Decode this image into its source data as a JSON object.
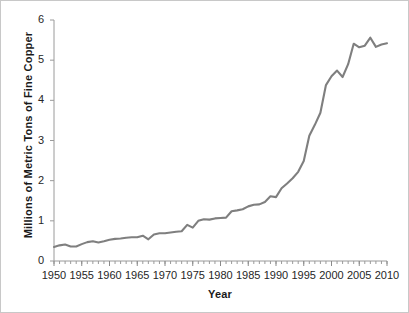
{
  "chart_data": {
    "type": "line",
    "title": "",
    "xlabel": "Year",
    "ylabel": "Millions of Metric Tons of Fine Copper",
    "xlim": [
      1950,
      2010
    ],
    "ylim": [
      0,
      6
    ],
    "grid": false,
    "legend": false,
    "line_color": "#7f7f7f",
    "x_tick_labels": [
      "1950",
      "1955",
      "1960",
      "1965",
      "1970",
      "1975",
      "1980",
      "1985",
      "1990",
      "1995",
      "2000",
      "2005",
      "2010"
    ],
    "x_ticks": [
      1950,
      1955,
      1960,
      1965,
      1970,
      1975,
      1980,
      1985,
      1990,
      1995,
      2000,
      2005,
      2010
    ],
    "x_minor_tick_interval": 1,
    "y_tick_labels": [
      "0",
      "1",
      "2",
      "3",
      "4",
      "5",
      "6"
    ],
    "y_ticks": [
      0,
      1,
      2,
      3,
      4,
      5,
      6
    ],
    "series": [
      {
        "name": "Fine Copper Production",
        "x": [
          1950,
          1951,
          1952,
          1953,
          1954,
          1955,
          1956,
          1957,
          1958,
          1959,
          1960,
          1961,
          1962,
          1963,
          1964,
          1965,
          1966,
          1967,
          1968,
          1969,
          1970,
          1971,
          1972,
          1973,
          1974,
          1975,
          1976,
          1977,
          1978,
          1979,
          1980,
          1981,
          1982,
          1983,
          1984,
          1985,
          1986,
          1987,
          1988,
          1989,
          1990,
          1991,
          1992,
          1993,
          1994,
          1995,
          1996,
          1997,
          1998,
          1999,
          2000,
          2001,
          2002,
          2003,
          2004,
          2005,
          2006,
          2007,
          2008,
          2009,
          2010
        ],
        "y": [
          0.35,
          0.39,
          0.41,
          0.36,
          0.36,
          0.42,
          0.47,
          0.49,
          0.46,
          0.49,
          0.53,
          0.55,
          0.56,
          0.58,
          0.59,
          0.59,
          0.63,
          0.54,
          0.66,
          0.69,
          0.69,
          0.71,
          0.73,
          0.74,
          0.9,
          0.83,
          1.0,
          1.04,
          1.03,
          1.06,
          1.07,
          1.08,
          1.24,
          1.26,
          1.29,
          1.36,
          1.4,
          1.41,
          1.47,
          1.61,
          1.59,
          1.81,
          1.93,
          2.06,
          2.22,
          2.49,
          3.12,
          3.39,
          3.69,
          4.38,
          4.6,
          4.74,
          4.58,
          4.9,
          5.41,
          5.32,
          5.36,
          5.56,
          5.33,
          5.39,
          5.42
        ]
      }
    ]
  },
  "axis": {
    "x_title": "Year",
    "y_title": "Millions of Metric Tons of Fine Copper"
  }
}
